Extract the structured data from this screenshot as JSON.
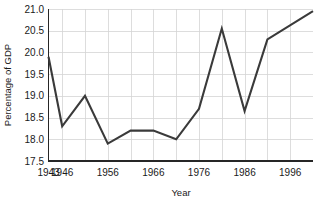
{
  "chart_data": {
    "type": "line",
    "title": "",
    "xlabel": "Year",
    "ylabel": "Percentage of GDP",
    "xlim": [
      1943,
      2001
    ],
    "ylim": [
      17.5,
      21.0
    ],
    "grid": true,
    "legend": false,
    "y_ticks": [
      "17.5",
      "18.0",
      "18.5",
      "19.0",
      "19.5",
      "20.0",
      "20.5",
      "21.0"
    ],
    "y_tick_values": [
      17.5,
      18.0,
      18.5,
      19.0,
      19.5,
      20.0,
      20.5,
      21.0
    ],
    "x_ticks": [
      "1943",
      "1946",
      "1956",
      "1966",
      "1976",
      "1986",
      "1996"
    ],
    "x_tick_values": [
      1943,
      1946,
      1956,
      1966,
      1976,
      1986,
      1996
    ],
    "x_gridline_values": [
      1946,
      1951,
      1956,
      1961,
      1966,
      1971,
      1976,
      1981,
      1986,
      1991,
      1996,
      2001
    ],
    "line_color": "#3a3a3a",
    "grid_color": "#d4d4d4",
    "axis_color": "#262626",
    "background_color": "#ffffff",
    "series": [
      {
        "name": "Percentage of GDP",
        "x": [
          1943,
          1946,
          1951,
          1956,
          1961,
          1966,
          1971,
          1976,
          1981,
          1986,
          1991,
          2001
        ],
        "values": [
          19.9,
          18.3,
          19.0,
          17.9,
          18.2,
          18.2,
          18.0,
          18.7,
          20.55,
          18.65,
          20.3,
          20.95
        ]
      }
    ]
  },
  "axes": {
    "y_title": "Percentage of GDP",
    "x_title": "Year"
  }
}
